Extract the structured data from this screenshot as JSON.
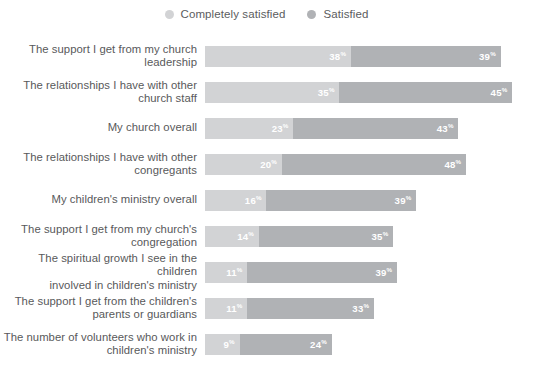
{
  "chart_data": {
    "type": "bar",
    "subtype": "stacked-horizontal-bar",
    "title": "",
    "xlabel": "",
    "ylabel": "",
    "xlim": [
      0,
      80
    ],
    "grid": false,
    "legend_position": "top-center",
    "value_suffix": "%",
    "categories": [
      "The support I get from my church\nleadership",
      "The relationships I have with other\nchurch staff",
      "My church overall",
      "The relationships I have with other\ncongregants",
      "My children's ministry overall",
      "The support I get from my church's\ncongregation",
      "The spiritual growth I see in the children\ninvolved in children's ministry",
      "The support I get from the children's\nparents or guardians",
      "The number of volunteers who work in\nchildren's ministry"
    ],
    "series": [
      {
        "name": "Completely satisfied",
        "color": "#d2d3d5",
        "values": [
          38,
          35,
          23,
          20,
          16,
          14,
          11,
          11,
          9
        ]
      },
      {
        "name": "Satisfied",
        "color": "#b0b2b5",
        "values": [
          39,
          45,
          43,
          48,
          39,
          35,
          39,
          33,
          24
        ]
      }
    ],
    "totals": [
      77,
      80,
      66,
      68,
      55,
      49,
      50,
      44,
      33
    ]
  },
  "legend": {
    "items": [
      {
        "label": "Completely satisfied",
        "color": "#d2d3d5",
        "marker": "circle-swatch"
      },
      {
        "label": "Satisfied",
        "color": "#b0b2b5",
        "marker": "circle-swatch"
      }
    ]
  },
  "rows": [
    {
      "label": "The support I get from my church\nleadership",
      "segments": [
        {
          "series": "Completely satisfied",
          "value": 38,
          "value_text": "38",
          "suffix": "%"
        },
        {
          "series": "Satisfied",
          "value": 39,
          "value_text": "39",
          "suffix": "%"
        }
      ]
    },
    {
      "label": "The relationships I have with other\nchurch staff",
      "segments": [
        {
          "series": "Completely satisfied",
          "value": 35,
          "value_text": "35",
          "suffix": "%"
        },
        {
          "series": "Satisfied",
          "value": 45,
          "value_text": "45",
          "suffix": "%"
        }
      ]
    },
    {
      "label": "My church overall",
      "segments": [
        {
          "series": "Completely satisfied",
          "value": 23,
          "value_text": "23",
          "suffix": "%"
        },
        {
          "series": "Satisfied",
          "value": 43,
          "value_text": "43",
          "suffix": "%"
        }
      ]
    },
    {
      "label": "The relationships I have with other\ncongregants",
      "segments": [
        {
          "series": "Completely satisfied",
          "value": 20,
          "value_text": "20",
          "suffix": "%"
        },
        {
          "series": "Satisfied",
          "value": 48,
          "value_text": "48",
          "suffix": "%"
        }
      ]
    },
    {
      "label": "My children's ministry overall",
      "segments": [
        {
          "series": "Completely satisfied",
          "value": 16,
          "value_text": "16",
          "suffix": "%"
        },
        {
          "series": "Satisfied",
          "value": 39,
          "value_text": "39",
          "suffix": "%"
        }
      ]
    },
    {
      "label": "The support I get from my church's\ncongregation",
      "segments": [
        {
          "series": "Completely satisfied",
          "value": 14,
          "value_text": "14",
          "suffix": "%"
        },
        {
          "series": "Satisfied",
          "value": 35,
          "value_text": "35",
          "suffix": "%"
        }
      ]
    },
    {
      "label": "The spiritual growth I see in the children\ninvolved in children's ministry",
      "segments": [
        {
          "series": "Completely satisfied",
          "value": 11,
          "value_text": "11",
          "suffix": "%"
        },
        {
          "series": "Satisfied",
          "value": 39,
          "value_text": "39",
          "suffix": "%"
        }
      ]
    },
    {
      "label": "The support I get from the children's\nparents or guardians",
      "segments": [
        {
          "series": "Completely satisfied",
          "value": 11,
          "value_text": "11",
          "suffix": "%"
        },
        {
          "series": "Satisfied",
          "value": 33,
          "value_text": "33",
          "suffix": "%"
        }
      ]
    },
    {
      "label": "The number of volunteers who work in\nchildren's ministry",
      "segments": [
        {
          "series": "Completely satisfied",
          "value": 9,
          "value_text": "9",
          "suffix": "%"
        },
        {
          "series": "Satisfied",
          "value": 24,
          "value_text": "24",
          "suffix": "%"
        }
      ]
    }
  ],
  "scale": {
    "px_per_unit": 3.84,
    "bar_origin_x": 213
  },
  "colors": {
    "completely_satisfied": "#d2d3d5",
    "satisfied": "#b0b2b5",
    "label_text": "#58595b",
    "value_text": "#ffffff",
    "background": "#ffffff"
  }
}
